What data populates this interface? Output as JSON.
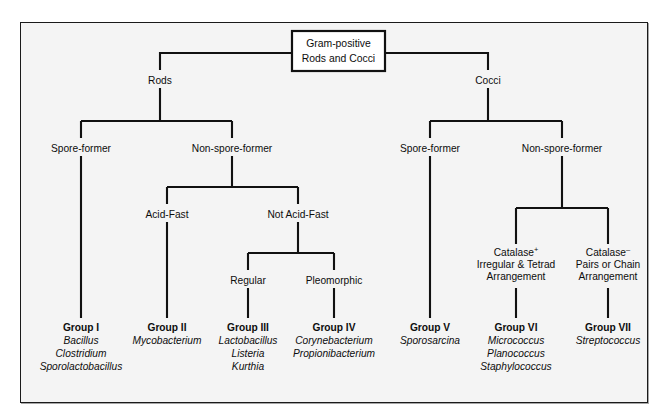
{
  "figure": {
    "title": "Gram-positive Rods and Cocci",
    "background_color": "#f4f4f4",
    "line_color": "#111111",
    "text_color": "#0d0d0d"
  },
  "root": {
    "line1": "Gram-positive",
    "line2": "Rods and Cocci"
  },
  "nodes": {
    "rods": "Rods",
    "cocci": "Cocci",
    "rods_spore_former": "Spore-former",
    "rods_non_spore_former": "Non-spore-former",
    "acid_fast": "Acid-Fast",
    "not_acid_fast": "Not Acid-Fast",
    "regular": "Regular",
    "pleomorphic": "Pleomorphic",
    "cocci_spore_former": "Spore-former",
    "cocci_non_spore_former": "Non-spore-former",
    "catalase_pos": {
      "line1_base": "Catalase",
      "line1_sup": "+",
      "line2": "Irregular & Tetrad",
      "line3": "Arrangement"
    },
    "catalase_neg": {
      "line1_base": "Catalase",
      "line1_sup": "–",
      "line2": "Pairs or Chain",
      "line3": "Arrangement"
    }
  },
  "groups": [
    {
      "id": "group-1",
      "title": "Group I",
      "genera": [
        "Bacillus",
        "Clostridium",
        "Sporolactobacillus"
      ]
    },
    {
      "id": "group-2",
      "title": "Group II",
      "genera": [
        "Mycobacterium"
      ]
    },
    {
      "id": "group-3",
      "title": "Group III",
      "genera": [
        "Lactobacillus",
        "Listeria",
        "Kurthia"
      ]
    },
    {
      "id": "group-4",
      "title": "Group IV",
      "genera": [
        "Corynebacterium",
        "Propionibacterium"
      ]
    },
    {
      "id": "group-5",
      "title": "Group V",
      "genera": [
        "Sporosarcina"
      ]
    },
    {
      "id": "group-6",
      "title": "Group VI",
      "genera": [
        "Micrococcus",
        "Planococcus",
        "Staphylococcus"
      ]
    },
    {
      "id": "group-7",
      "title": "Group VII",
      "genera": [
        "Streptococcus"
      ]
    }
  ]
}
